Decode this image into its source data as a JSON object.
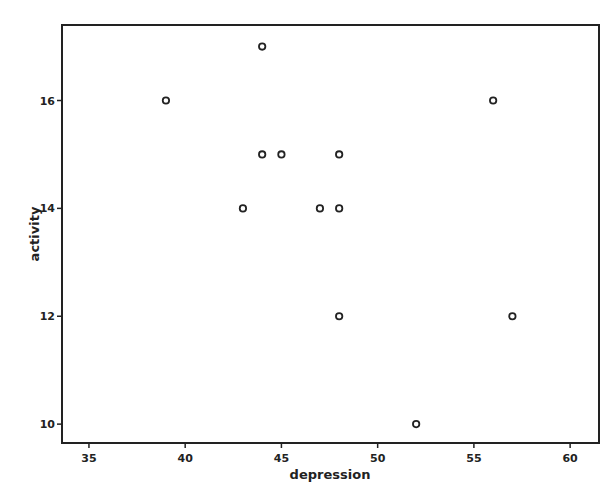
{
  "chart_data": {
    "type": "scatter",
    "title": "",
    "xlabel": "depression",
    "ylabel": "activity",
    "xlim": [
      33.6,
      61.5
    ],
    "ylim": [
      9.65,
      17.4
    ],
    "xticks": [
      35,
      40,
      45,
      50,
      55,
      60
    ],
    "yticks": [
      10,
      12,
      14,
      16
    ],
    "grid": false,
    "legend": null,
    "marker": "open-circle",
    "points": [
      {
        "x": 39,
        "y": 16
      },
      {
        "x": 44,
        "y": 17
      },
      {
        "x": 44,
        "y": 15
      },
      {
        "x": 45,
        "y": 15
      },
      {
        "x": 48,
        "y": 15
      },
      {
        "x": 43,
        "y": 14
      },
      {
        "x": 47,
        "y": 14
      },
      {
        "x": 48,
        "y": 14
      },
      {
        "x": 48,
        "y": 12
      },
      {
        "x": 52,
        "y": 10
      },
      {
        "x": 56,
        "y": 16
      },
      {
        "x": 57,
        "y": 12
      }
    ]
  },
  "style": {
    "axis_color": "#222222",
    "marker_color": "#222222",
    "background": "#ffffff"
  }
}
